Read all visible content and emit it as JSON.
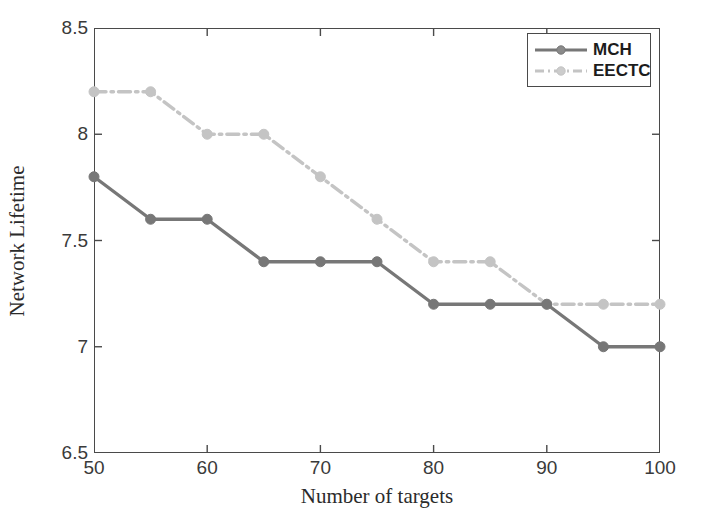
{
  "chart_data": {
    "type": "line",
    "title": "",
    "xlabel": "Number of targets",
    "ylabel": "Network Lifetime",
    "xlim": [
      50,
      100
    ],
    "ylim": [
      6.5,
      8.5
    ],
    "xticks": [
      50,
      60,
      70,
      80,
      90,
      100
    ],
    "yticks": [
      6.5,
      7,
      7.5,
      8,
      8.5
    ],
    "xtick_labels": [
      "50",
      "60",
      "70",
      "80",
      "90",
      "100"
    ],
    "ytick_labels": [
      "6.5",
      "7",
      "7.5",
      "8",
      "8.5"
    ],
    "grid": false,
    "legend_position": "upper right",
    "x": [
      50,
      55,
      60,
      65,
      70,
      75,
      80,
      85,
      90,
      95,
      100
    ],
    "series": [
      {
        "name": "MCH",
        "values": [
          7.8,
          7.6,
          7.6,
          7.4,
          7.4,
          7.4,
          7.2,
          7.2,
          7.2,
          7.0,
          7.0
        ],
        "color": "#777777",
        "linestyle": "solid",
        "marker": "circle"
      },
      {
        "name": "EECTC",
        "values": [
          8.2,
          8.2,
          8.0,
          8.0,
          7.8,
          7.6,
          7.4,
          7.4,
          7.2,
          7.2,
          7.2
        ],
        "color": "#c4c4c4",
        "linestyle": "dashdot",
        "marker": "circle"
      }
    ]
  },
  "legend": {
    "items": [
      {
        "label": "MCH"
      },
      {
        "label": "EECTC"
      }
    ]
  },
  "axes": {
    "frame_color": "#4a4a4a"
  }
}
